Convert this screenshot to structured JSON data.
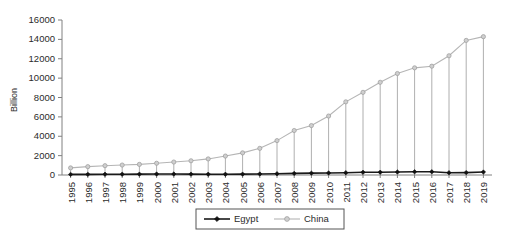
{
  "chart_data": {
    "type": "line",
    "title": "",
    "xlabel": "",
    "ylabel": "Billion",
    "ylim": [
      0,
      16000
    ],
    "ytick_step": 2000,
    "yticks": [
      "0",
      "2000",
      "4000",
      "6000",
      "8000",
      "10000",
      "12000",
      "14000",
      "16000"
    ],
    "grid": false,
    "legend_position": "bottom-center",
    "categories": [
      "1995",
      "1996",
      "1997",
      "1998",
      "1999",
      "2000",
      "2001",
      "2002",
      "2003",
      "2004",
      "2005",
      "2006",
      "2007",
      "2008",
      "2009",
      "2010",
      "2011",
      "2012",
      "2013",
      "2014",
      "2015",
      "2016",
      "2017",
      "2018",
      "2019"
    ],
    "series": [
      {
        "name": "Egypt",
        "color": "#111111",
        "marker": "diamond",
        "values": [
          60,
          68,
          78,
          84,
          90,
          99,
          97,
          88,
          82,
          79,
          90,
          108,
          130,
          163,
          189,
          214,
          236,
          279,
          288,
          305,
          332,
          332,
          236,
          250,
          303
        ]
      },
      {
        "name": "China",
        "color": "#b5b5b5",
        "marker": "circle",
        "values": [
          734,
          863,
          962,
          1029,
          1094,
          1211,
          1339,
          1470,
          1660,
          1955,
          2286,
          2752,
          3550,
          4594,
          5102,
          6087,
          7552,
          8532,
          9570,
          10476,
          11062,
          11233,
          12310,
          13895,
          14280
        ]
      }
    ]
  },
  "legend": {
    "items": [
      {
        "label": "Egypt"
      },
      {
        "label": "China"
      }
    ]
  },
  "axis": {
    "y_title": "Billion"
  }
}
